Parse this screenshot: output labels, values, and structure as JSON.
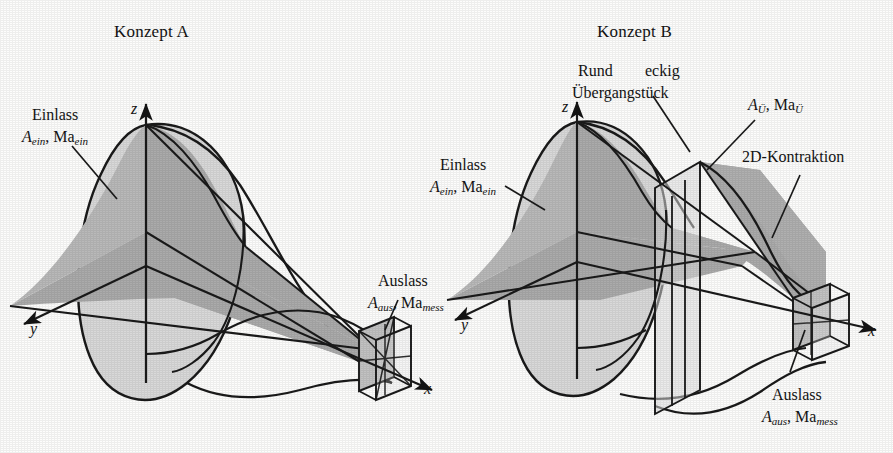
{
  "figure": {
    "background_color": "#fdfdfc",
    "ink_color": "#141414",
    "fill_light": "#d9d9d9",
    "fill_mid": "#c2c2c2",
    "fill_dark": "#ababab"
  },
  "panels": [
    {
      "id": "konzept-a",
      "title": "Konzept A",
      "axes": {
        "x": "x",
        "y": "y",
        "z": "z"
      },
      "labels": [
        {
          "name": "inlet",
          "line1": "Einlass",
          "sym": "A",
          "sym_sub": "ein",
          "sym2": "Ma",
          "sym2_sub": "ein"
        },
        {
          "name": "outlet",
          "line1": "Auslass",
          "sym": "A",
          "sym_sub": "aus",
          "sym2": "Ma",
          "sym2_sub": "mess"
        }
      ]
    },
    {
      "id": "konzept-b",
      "title": "Konzept B",
      "axes": {
        "x": "x",
        "y": "y",
        "z": "z"
      },
      "labels": [
        {
          "name": "transition",
          "line1": "Rund",
          "line1b": "eckig",
          "line2": "Übergangstück"
        },
        {
          "name": "transition-state",
          "sym": "A",
          "sym_sub": "Ü",
          "sym2": "Ma",
          "sym2_sub": "Ü"
        },
        {
          "name": "contraction",
          "line1": "2D-Kontraktion"
        },
        {
          "name": "inlet",
          "line1": "Einlass",
          "sym": "A",
          "sym_sub": "ein",
          "sym2": "Ma",
          "sym2_sub": "ein"
        },
        {
          "name": "outlet",
          "line1": "Auslass",
          "sym": "A",
          "sym_sub": "aus",
          "sym2": "Ma",
          "sym2_sub": "mess"
        }
      ]
    }
  ]
}
